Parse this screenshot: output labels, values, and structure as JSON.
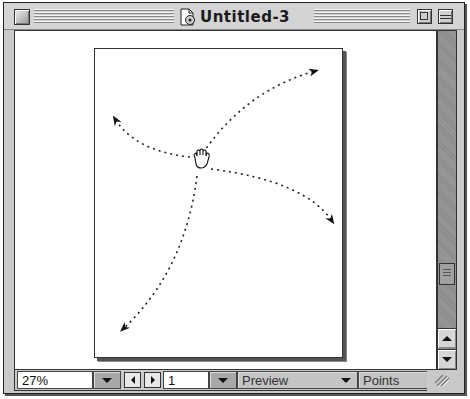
{
  "window": {
    "title": "Untitled-3",
    "icons": {
      "close": "close-box-icon",
      "document": "document-icon",
      "zoom": "zoom-box-icon",
      "collapse": "collapse-box-icon"
    }
  },
  "canvas": {
    "cursor": "hand-grab-icon",
    "drawing": {
      "description": "Four dashed curved arrows radiating from a central hand cursor",
      "arrows": [
        {
          "direction": "up-right"
        },
        {
          "direction": "up-left"
        },
        {
          "direction": "down-right"
        },
        {
          "direction": "down-left"
        }
      ]
    }
  },
  "statusbar": {
    "zoom_value": "27%",
    "page_number": "1",
    "view_mode": "Preview",
    "units": "Points"
  },
  "colors": {
    "chrome": "#c9c9c9",
    "canvas": "#ffffff",
    "scrollbar": "#8f8f8f"
  }
}
